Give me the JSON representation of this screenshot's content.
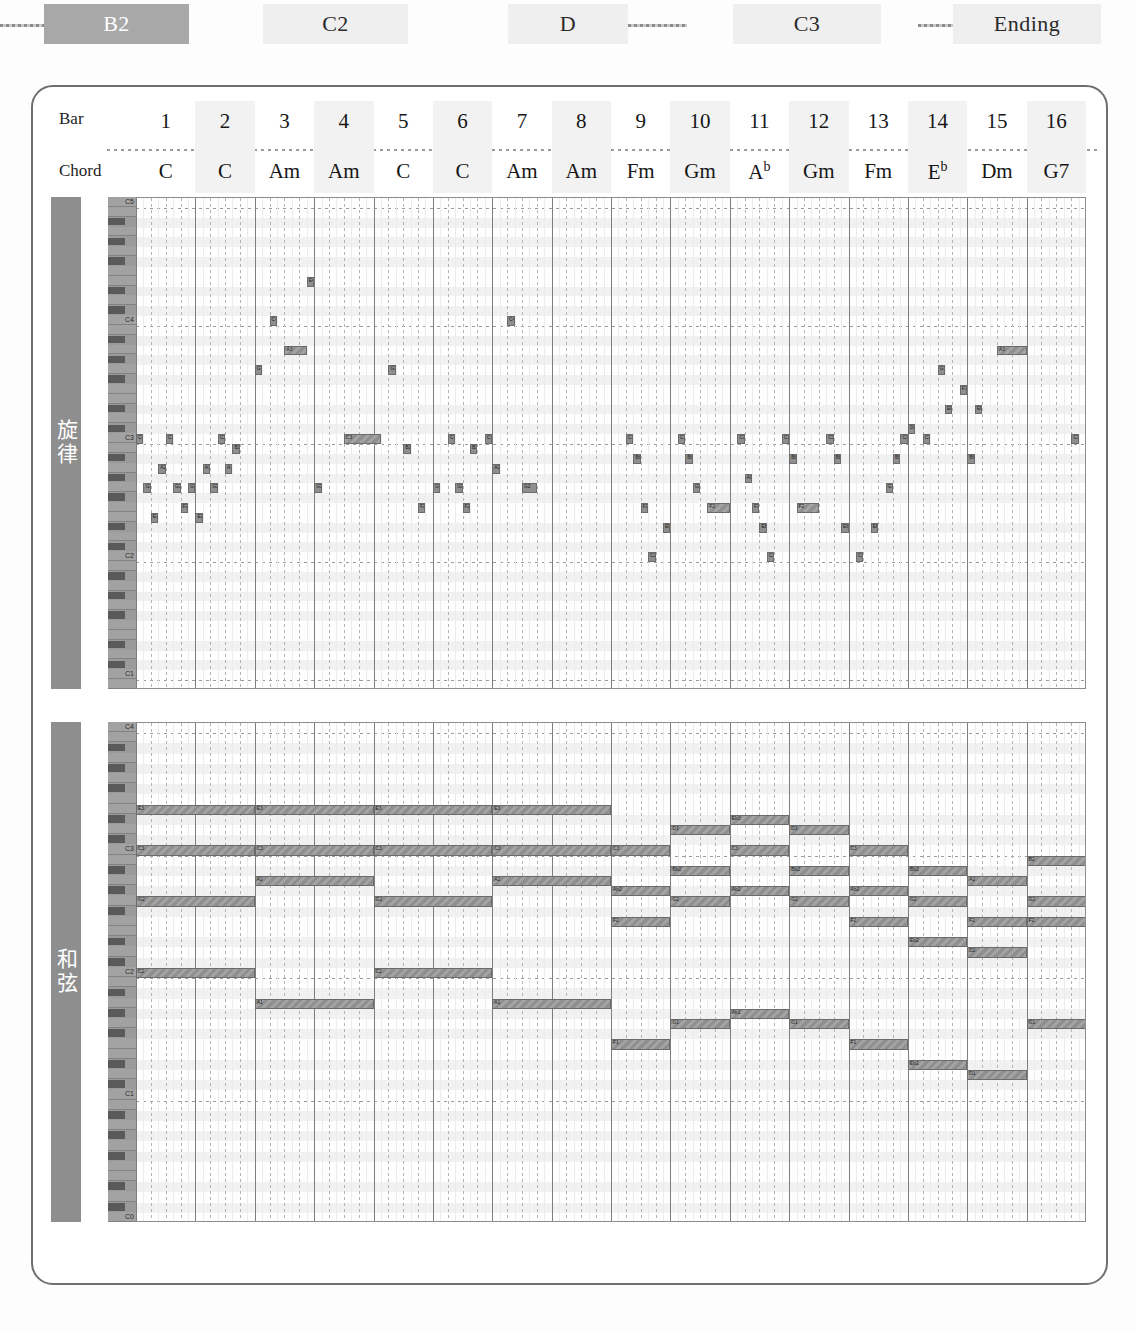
{
  "section_strip": {
    "sections": [
      {
        "label": "B2",
        "active": true
      },
      {
        "label": "C2",
        "active": false
      },
      {
        "label": "D",
        "active": false
      },
      {
        "label": "C3",
        "active": false
      },
      {
        "label": "Ending",
        "active": false
      }
    ]
  },
  "header": {
    "bar_label": "Bar",
    "chord_label": "Chord",
    "bars": [
      "1",
      "2",
      "3",
      "4",
      "5",
      "6",
      "7",
      "8",
      "9",
      "10",
      "11",
      "12",
      "13",
      "14",
      "15",
      "16"
    ],
    "chords": [
      {
        "root": "C",
        "sup": ""
      },
      {
        "root": "C",
        "sup": ""
      },
      {
        "root": "Am",
        "sup": ""
      },
      {
        "root": "Am",
        "sup": ""
      },
      {
        "root": "C",
        "sup": ""
      },
      {
        "root": "C",
        "sup": ""
      },
      {
        "root": "Am",
        "sup": ""
      },
      {
        "root": "Am",
        "sup": ""
      },
      {
        "root": "Fm",
        "sup": ""
      },
      {
        "root": "Gm",
        "sup": ""
      },
      {
        "root": "A",
        "sup": "b"
      },
      {
        "root": "Gm",
        "sup": ""
      },
      {
        "root": "Fm",
        "sup": ""
      },
      {
        "root": "E",
        "sup": "b"
      },
      {
        "root": "Dm",
        "sup": ""
      },
      {
        "root": "G7",
        "sup": ""
      }
    ]
  },
  "tracks": [
    {
      "name": "melody",
      "tab_label": "旋律",
      "pitch_top": "C6",
      "pitch_bottom": "B1",
      "top_midi": 84,
      "bottom_midi": 35,
      "octave_labels": [
        "C4",
        "C3",
        "C2"
      ],
      "notes": [
        {
          "p": 60,
          "s": 0.0,
          "d": 0.5,
          "n": "C3"
        },
        {
          "p": 55,
          "s": 0.5,
          "d": 0.5,
          "n": "G2"
        },
        {
          "p": 52,
          "s": 1.0,
          "d": 0.5,
          "n": "E2"
        },
        {
          "p": 57,
          "s": 1.5,
          "d": 0.5,
          "n": "A2"
        },
        {
          "p": 60,
          "s": 2.0,
          "d": 0.5,
          "n": "C3"
        },
        {
          "p": 55,
          "s": 2.5,
          "d": 0.5,
          "n": "G2"
        },
        {
          "p": 53,
          "s": 3.0,
          "d": 0.5,
          "n": "F2"
        },
        {
          "p": 55,
          "s": 3.5,
          "d": 0.5,
          "n": "G2"
        },
        {
          "p": 52,
          "s": 4.0,
          "d": 0.5,
          "n": "E2"
        },
        {
          "p": 57,
          "s": 4.5,
          "d": 0.5,
          "n": "A2"
        },
        {
          "p": 55,
          "s": 5.0,
          "d": 0.5,
          "n": "G2"
        },
        {
          "p": 60,
          "s": 5.5,
          "d": 0.5,
          "n": "C3"
        },
        {
          "p": 57,
          "s": 6.0,
          "d": 0.5,
          "n": "A2"
        },
        {
          "p": 59,
          "s": 6.5,
          "d": 0.5,
          "n": "B2"
        },
        {
          "p": 67,
          "s": 8.0,
          "d": 0.5,
          "n": "G3"
        },
        {
          "p": 72,
          "s": 9.0,
          "d": 0.5,
          "n": "C4"
        },
        {
          "p": 69,
          "s": 10.0,
          "d": 1.5,
          "n": "A3"
        },
        {
          "p": 76,
          "s": 11.5,
          "d": 0.5,
          "n": "E4"
        },
        {
          "p": 55,
          "s": 12.0,
          "d": 0.5,
          "n": "G2"
        },
        {
          "p": 60,
          "s": 14.0,
          "d": 2.5,
          "n": "C3"
        },
        {
          "p": 67,
          "s": 17.0,
          "d": 0.5,
          "n": "G3"
        },
        {
          "p": 59,
          "s": 18.0,
          "d": 0.5,
          "n": "B2"
        },
        {
          "p": 53,
          "s": 19.0,
          "d": 0.5,
          "n": "F2"
        },
        {
          "p": 55,
          "s": 20.0,
          "d": 0.5,
          "n": "G2"
        },
        {
          "p": 60,
          "s": 21.0,
          "d": 0.5,
          "n": "C3"
        },
        {
          "p": 55,
          "s": 21.5,
          "d": 0.5,
          "n": "G2"
        },
        {
          "p": 53,
          "s": 22.0,
          "d": 0.5,
          "n": "F2"
        },
        {
          "p": 59,
          "s": 22.5,
          "d": 0.5,
          "n": "B2"
        },
        {
          "p": 60,
          "s": 23.5,
          "d": 0.5,
          "n": "C3"
        },
        {
          "p": 57,
          "s": 24.0,
          "d": 0.5,
          "n": "A2"
        },
        {
          "p": 72,
          "s": 25.0,
          "d": 0.5,
          "n": "C4"
        },
        {
          "p": 55,
          "s": 26.0,
          "d": 1.0,
          "n": "G2"
        },
        {
          "p": 60,
          "s": 33.0,
          "d": 0.5,
          "n": "C3"
        },
        {
          "p": 58,
          "s": 33.5,
          "d": 0.5,
          "n": "Bb2"
        },
        {
          "p": 53,
          "s": 34.0,
          "d": 0.5,
          "n": "F2"
        },
        {
          "p": 48,
          "s": 34.5,
          "d": 0.5,
          "n": "C2"
        },
        {
          "p": 51,
          "s": 35.5,
          "d": 0.5,
          "n": "Eb2"
        },
        {
          "p": 60,
          "s": 36.5,
          "d": 0.5,
          "n": "C3"
        },
        {
          "p": 58,
          "s": 37.0,
          "d": 0.5,
          "n": "Bb2"
        },
        {
          "p": 55,
          "s": 37.5,
          "d": 0.5,
          "n": "G2"
        },
        {
          "p": 53,
          "s": 38.5,
          "d": 1.5,
          "n": "F2"
        },
        {
          "p": 60,
          "s": 40.5,
          "d": 0.5,
          "n": "C3"
        },
        {
          "p": 56,
          "s": 41.0,
          "d": 0.5,
          "n": "Ab2"
        },
        {
          "p": 53,
          "s": 41.5,
          "d": 0.5,
          "n": "F2"
        },
        {
          "p": 51,
          "s": 42.0,
          "d": 0.5,
          "n": "Eb2"
        },
        {
          "p": 48,
          "s": 42.5,
          "d": 0.5,
          "n": "C2"
        },
        {
          "p": 60,
          "s": 43.5,
          "d": 0.5,
          "n": "C3"
        },
        {
          "p": 58,
          "s": 44.0,
          "d": 0.5,
          "n": "Bb2"
        },
        {
          "p": 53,
          "s": 44.5,
          "d": 1.5,
          "n": "F2"
        },
        {
          "p": 60,
          "s": 46.5,
          "d": 0.5,
          "n": "C3"
        },
        {
          "p": 58,
          "s": 47.0,
          "d": 0.5,
          "n": "Bb2"
        },
        {
          "p": 51,
          "s": 47.5,
          "d": 0.5,
          "n": "Eb2"
        },
        {
          "p": 48,
          "s": 48.5,
          "d": 0.5,
          "n": "C2"
        },
        {
          "p": 51,
          "s": 49.5,
          "d": 0.5,
          "n": "Eb2"
        },
        {
          "p": 55,
          "s": 50.5,
          "d": 0.5,
          "n": "G2"
        },
        {
          "p": 58,
          "s": 51.0,
          "d": 0.5,
          "n": "Bb2"
        },
        {
          "p": 60,
          "s": 51.5,
          "d": 0.5,
          "n": "C3"
        },
        {
          "p": 61,
          "s": 52.0,
          "d": 0.5,
          "n": "Db3"
        },
        {
          "p": 60,
          "s": 53.0,
          "d": 0.5,
          "n": "C3"
        },
        {
          "p": 67,
          "s": 54.0,
          "d": 0.5,
          "n": "G3"
        },
        {
          "p": 63,
          "s": 54.5,
          "d": 0.5,
          "n": "Eb3"
        },
        {
          "p": 65,
          "s": 55.5,
          "d": 0.5,
          "n": "F3"
        },
        {
          "p": 58,
          "s": 56.0,
          "d": 0.5,
          "n": "Bb2"
        },
        {
          "p": 63,
          "s": 56.5,
          "d": 0.5,
          "n": "Eb3"
        },
        {
          "p": 69,
          "s": 58.0,
          "d": 2.0,
          "n": "A3"
        },
        {
          "p": 60,
          "s": 63.0,
          "d": 0.5,
          "n": "C3"
        }
      ]
    },
    {
      "name": "chord",
      "tab_label": "和弦",
      "pitch_top": "C4",
      "pitch_bottom": "C0",
      "top_midi": 72,
      "bottom_midi": 24,
      "octave_labels": [
        "C3",
        "C2",
        "C1"
      ],
      "notes": [
        {
          "p": 64,
          "s": 0.0,
          "d": 8.0,
          "n": "E3"
        },
        {
          "p": 60,
          "s": 0.0,
          "d": 8.0,
          "n": "C3"
        },
        {
          "p": 55,
          "s": 0.0,
          "d": 8.0,
          "n": "G2"
        },
        {
          "p": 48,
          "s": 0.0,
          "d": 8.0,
          "n": "C2"
        },
        {
          "p": 64,
          "s": 8.0,
          "d": 8.0,
          "n": "E3"
        },
        {
          "p": 60,
          "s": 8.0,
          "d": 8.0,
          "n": "C3"
        },
        {
          "p": 57,
          "s": 8.0,
          "d": 8.0,
          "n": "A2"
        },
        {
          "p": 45,
          "s": 8.0,
          "d": 8.0,
          "n": "A1"
        },
        {
          "p": 64,
          "s": 16.0,
          "d": 8.0,
          "n": "E3"
        },
        {
          "p": 60,
          "s": 16.0,
          "d": 8.0,
          "n": "C3"
        },
        {
          "p": 55,
          "s": 16.0,
          "d": 8.0,
          "n": "G2"
        },
        {
          "p": 48,
          "s": 16.0,
          "d": 8.0,
          "n": "C2"
        },
        {
          "p": 64,
          "s": 24.0,
          "d": 8.0,
          "n": "E3"
        },
        {
          "p": 60,
          "s": 24.0,
          "d": 8.0,
          "n": "C3"
        },
        {
          "p": 57,
          "s": 24.0,
          "d": 8.0,
          "n": "A2"
        },
        {
          "p": 45,
          "s": 24.0,
          "d": 8.0,
          "n": "A1"
        },
        {
          "p": 60,
          "s": 32.0,
          "d": 4.0,
          "n": "C3"
        },
        {
          "p": 56,
          "s": 32.0,
          "d": 4.0,
          "n": "Ab2"
        },
        {
          "p": 53,
          "s": 32.0,
          "d": 4.0,
          "n": "F2"
        },
        {
          "p": 41,
          "s": 32.0,
          "d": 4.0,
          "n": "F1"
        },
        {
          "p": 62,
          "s": 36.0,
          "d": 4.0,
          "n": "D3"
        },
        {
          "p": 58,
          "s": 36.0,
          "d": 4.0,
          "n": "Bb2"
        },
        {
          "p": 55,
          "s": 36.0,
          "d": 4.0,
          "n": "G2"
        },
        {
          "p": 43,
          "s": 36.0,
          "d": 4.0,
          "n": "G1"
        },
        {
          "p": 63,
          "s": 40.0,
          "d": 4.0,
          "n": "Eb3"
        },
        {
          "p": 60,
          "s": 40.0,
          "d": 4.0,
          "n": "C3"
        },
        {
          "p": 56,
          "s": 40.0,
          "d": 4.0,
          "n": "Ab2"
        },
        {
          "p": 44,
          "s": 40.0,
          "d": 4.0,
          "n": "Ab1"
        },
        {
          "p": 62,
          "s": 44.0,
          "d": 4.0,
          "n": "D3"
        },
        {
          "p": 58,
          "s": 44.0,
          "d": 4.0,
          "n": "Bb2"
        },
        {
          "p": 55,
          "s": 44.0,
          "d": 4.0,
          "n": "G2"
        },
        {
          "p": 43,
          "s": 44.0,
          "d": 4.0,
          "n": "G1"
        },
        {
          "p": 60,
          "s": 48.0,
          "d": 4.0,
          "n": "C3"
        },
        {
          "p": 56,
          "s": 48.0,
          "d": 4.0,
          "n": "Ab2"
        },
        {
          "p": 53,
          "s": 48.0,
          "d": 4.0,
          "n": "F2"
        },
        {
          "p": 41,
          "s": 48.0,
          "d": 4.0,
          "n": "F1"
        },
        {
          "p": 58,
          "s": 52.0,
          "d": 4.0,
          "n": "Bb2"
        },
        {
          "p": 55,
          "s": 52.0,
          "d": 4.0,
          "n": "G2"
        },
        {
          "p": 51,
          "s": 52.0,
          "d": 4.0,
          "n": "Eb2"
        },
        {
          "p": 39,
          "s": 52.0,
          "d": 4.0,
          "n": "Eb1"
        },
        {
          "p": 57,
          "s": 56.0,
          "d": 4.0,
          "n": "A2"
        },
        {
          "p": 53,
          "s": 56.0,
          "d": 4.0,
          "n": "F2"
        },
        {
          "p": 50,
          "s": 56.0,
          "d": 4.0,
          "n": "D2"
        },
        {
          "p": 38,
          "s": 56.0,
          "d": 4.0,
          "n": "D1"
        },
        {
          "p": 59,
          "s": 60.0,
          "d": 4.0,
          "n": "B2"
        },
        {
          "p": 55,
          "s": 60.0,
          "d": 4.0,
          "n": "G2"
        },
        {
          "p": 53,
          "s": 60.0,
          "d": 4.0,
          "n": "F2"
        },
        {
          "p": 43,
          "s": 60.0,
          "d": 4.0,
          "n": "G1"
        }
      ]
    }
  ]
}
